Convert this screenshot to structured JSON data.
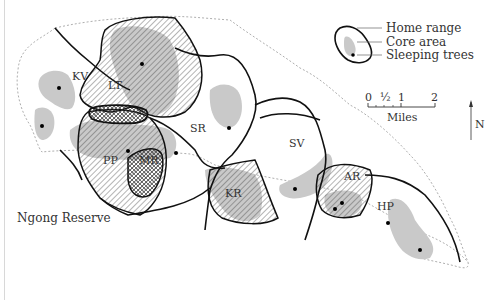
{
  "map": {
    "region_label": "Ngong Reserve",
    "troops": [
      {
        "code": "KV",
        "x": 72,
        "y": 80
      },
      {
        "code": "LT",
        "x": 110,
        "y": 88
      },
      {
        "code": "SR",
        "x": 190,
        "y": 131
      },
      {
        "code": "PP",
        "x": 102,
        "y": 160
      },
      {
        "code": "MR",
        "x": 138,
        "y": 160
      },
      {
        "code": "KR",
        "x": 224,
        "y": 194
      },
      {
        "code": "SV",
        "x": 288,
        "y": 146
      },
      {
        "code": "AR",
        "x": 343,
        "y": 177
      },
      {
        "code": "HP",
        "x": 377,
        "y": 207
      }
    ]
  },
  "legend": {
    "home_range": "Home range",
    "core_area": "Core area",
    "sleeping_trees": "Sleeping trees"
  },
  "scale": {
    "ticks": [
      "0",
      "½",
      "1",
      "2"
    ],
    "unit": "Miles"
  },
  "north_arrow": {
    "label": "N"
  },
  "colors": {
    "core_area": "#c9c9c9",
    "home_range_stroke": "#111111",
    "boundary_dashed": "#999999",
    "hatch": "#444444"
  }
}
